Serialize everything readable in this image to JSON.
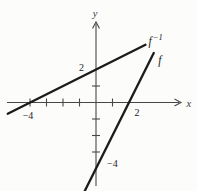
{
  "chart_data": {
    "type": "line",
    "title": "",
    "xlabel": "x",
    "ylabel": "y",
    "xlim": [
      -5.5,
      5.2
    ],
    "ylim": [
      -5.5,
      5.0
    ],
    "grid": false,
    "background_color": "#fcfcfb",
    "axis_color": "#474747",
    "line_color": "#1b1b1b",
    "x_ticks": [
      -4,
      -3,
      -2,
      -1,
      1
    ],
    "y_ticks": [
      1,
      -1,
      -2,
      -3
    ],
    "x_tick_labels": [
      {
        "value": -4,
        "label": "−4",
        "dx": -2,
        "dy": 2.5
      },
      {
        "value": 2,
        "label": "2",
        "dx": 8,
        "dy": -1
      }
    ],
    "y_tick_labels": [
      {
        "value": 2,
        "label": "2",
        "side": "left",
        "dx": 0,
        "dy": -2
      },
      {
        "value": -4,
        "label": "−4",
        "side": "right",
        "dx": 0,
        "dy": -5
      }
    ],
    "series": [
      {
        "name": "f-inverse",
        "label_base": "f",
        "label_sup": "−1",
        "points": [
          [
            -5.35,
            -0.68
          ],
          [
            3.0,
            3.5
          ]
        ],
        "x_intercept": -4,
        "y_intercept": 2,
        "label_offset_px": [
          3,
          0.5
        ]
      },
      {
        "name": "f",
        "label_base": "f",
        "label_sup": "",
        "points": [
          [
            -0.7,
            -5.4
          ],
          [
            3.5,
            3.0
          ]
        ],
        "x_intercept": 2,
        "y_intercept": -4,
        "label_offset_px": [
          4.5,
          11
        ]
      }
    ]
  }
}
